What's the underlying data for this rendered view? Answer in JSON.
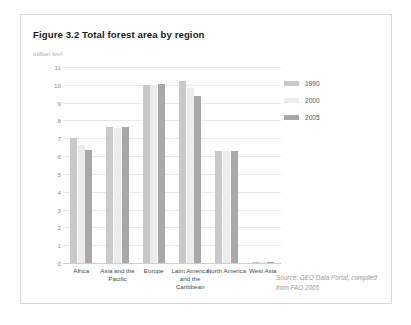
{
  "figure": {
    "title": "Figure 3.2 Total forest area by region",
    "source": "Source: GEO Data Portal, compiled from FAO 2005"
  },
  "legend": {
    "position": "right",
    "items": [
      {
        "label": "1990",
        "color": "#c9c9c9"
      },
      {
        "label": "2000",
        "color": "#ececec"
      },
      {
        "label": "2005",
        "color": "#a8a8a8"
      }
    ]
  },
  "colors": {
    "grid": "#e8e8e8",
    "axis": "#cfcfcf",
    "tick_text": "#8c8c8c",
    "category_text": "#4a4a4a",
    "title_text": "#1a1a1a",
    "unit_text": "#a8a8a8",
    "source_text": "#9a9a9a",
    "card_border": "#d8d8d8"
  },
  "chart_data": {
    "type": "bar",
    "title": "Figure 3.2 Total forest area by region",
    "subtitle": "",
    "xlabel": "",
    "ylabel": "million km²",
    "ylim": [
      0,
      11
    ],
    "yticks": [
      0,
      1,
      2,
      3,
      4,
      5,
      6,
      7,
      8,
      9,
      10,
      11
    ],
    "ytick_labels": [
      "0",
      "1",
      "2",
      "3",
      "4",
      "5",
      "6",
      "7",
      "8",
      "9",
      "10",
      "11"
    ],
    "grid": true,
    "legend_position": "right",
    "categories": [
      "Africa",
      "Asia and the Pacific",
      "Europe",
      "Latin America and the Caribbean",
      "North America",
      "West Asia"
    ],
    "series": [
      {
        "name": "1990",
        "color": "#c9c9c9",
        "values": [
          7.0,
          7.65,
          10.0,
          10.2,
          6.3,
          0.04
        ]
      },
      {
        "name": "2000",
        "color": "#ececec",
        "values": [
          6.6,
          7.6,
          10.0,
          9.8,
          6.3,
          0.04
        ]
      },
      {
        "name": "2005",
        "color": "#a8a8a8",
        "values": [
          6.35,
          7.65,
          10.05,
          9.4,
          6.3,
          0.04
        ]
      }
    ]
  }
}
